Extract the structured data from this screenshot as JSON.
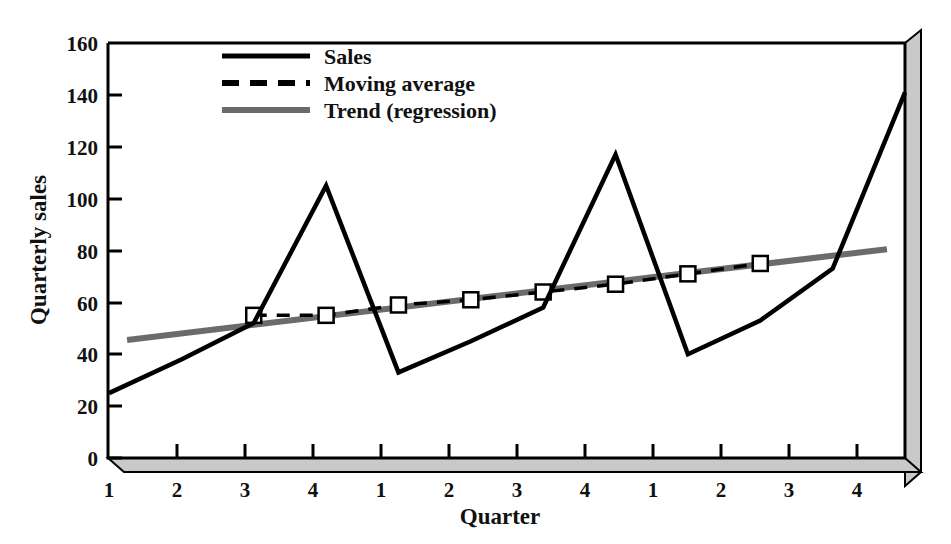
{
  "chart_data": {
    "type": "line",
    "title": "",
    "xlabel": "Quarter",
    "ylabel": "Quarterly sales",
    "xlim": [
      1,
      12
    ],
    "ylim": [
      0,
      160
    ],
    "grid": false,
    "legend_position": "top-center",
    "x": [
      1,
      2,
      3,
      4,
      5,
      6,
      7,
      8,
      9,
      10,
      11,
      12
    ],
    "xtick_labels": [
      "1",
      "2",
      "3",
      "4",
      "1",
      "2",
      "3",
      "4",
      "1",
      "2",
      "3",
      "4"
    ],
    "ytick_labels": [
      "0",
      "20",
      "40",
      "60",
      "80",
      "100",
      "120",
      "140",
      "160"
    ],
    "ytick_values": [
      0,
      20,
      40,
      60,
      80,
      100,
      120,
      140,
      160
    ],
    "series": [
      {
        "name": "Sales",
        "style": "solid",
        "color": "#000000",
        "width": 4,
        "marker": "none",
        "x": [
          1,
          2,
          3,
          4,
          5,
          6,
          7,
          8,
          9,
          10,
          11,
          12
        ],
        "values": [
          25,
          38,
          52,
          105,
          33,
          45,
          58,
          117,
          40,
          53,
          73,
          141
        ]
      },
      {
        "name": "Moving average",
        "style": "dashed",
        "color": "#000000",
        "width": 3,
        "marker": "square",
        "x": [
          3,
          4,
          5,
          6,
          7,
          8,
          9,
          10
        ],
        "values": [
          55,
          55,
          59,
          61,
          64,
          67,
          71,
          75
        ]
      },
      {
        "name": "Trend (regression)",
        "style": "solid",
        "color": "#6b6b6b",
        "width": 5,
        "marker": "none",
        "x": [
          1.25,
          11.75
        ],
        "values": [
          45.5,
          80.5
        ]
      }
    ]
  },
  "legend": {
    "items": [
      {
        "label": "Sales",
        "style": "solid",
        "color": "#000000"
      },
      {
        "label": "Moving average",
        "style": "dashed",
        "color": "#000000"
      },
      {
        "label": "Trend (regression)",
        "style": "solid",
        "color": "#6b6b6b"
      }
    ]
  },
  "axes": {
    "x_title": "Quarter",
    "y_title": "Quarterly sales"
  },
  "colors": {
    "sales": "#000000",
    "moving_average": "#000000",
    "trend": "#6b6b6b",
    "frame": "#000000",
    "shadow_fill": "#c9c9c9",
    "background": "#ffffff"
  }
}
